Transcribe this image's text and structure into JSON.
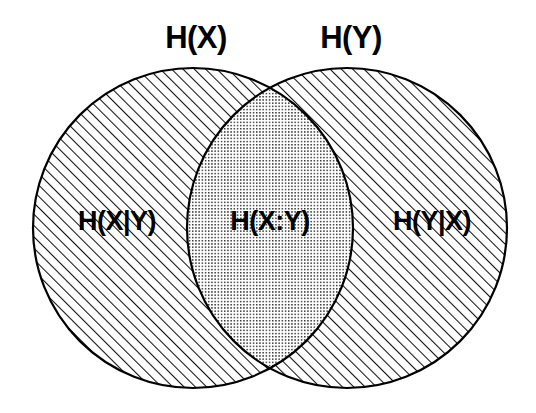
{
  "diagram": {
    "type": "venn-diagram",
    "background_color": "#ffffff",
    "stroke_color": "#000000",
    "labels": {
      "set_left": "H(X)",
      "set_right": "H(Y)",
      "region_left_only": "H(X|Y)",
      "region_intersection": "H(X:Y)",
      "region_right_only": "H(Y|X)"
    },
    "fills": {
      "left_only": "diagonal-hatch",
      "right_only": "diagonal-hatch",
      "intersection": "dot-stipple"
    },
    "geometry": {
      "left_circle": {
        "cx": 193,
        "cy": 228,
        "r": 160
      },
      "right_circle": {
        "cx": 347,
        "cy": 228,
        "r": 160
      }
    },
    "label_positions": {
      "set_left": {
        "x": 196,
        "y": 38
      },
      "set_right": {
        "x": 351,
        "y": 38
      },
      "region_left_only": {
        "x": 117,
        "y": 222
      },
      "region_intersection": {
        "x": 270,
        "y": 222
      },
      "region_right_only": {
        "x": 432,
        "y": 222
      }
    }
  }
}
